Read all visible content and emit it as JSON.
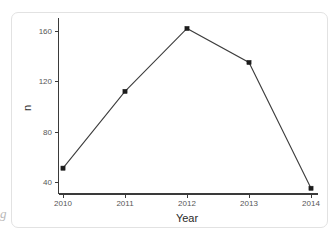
{
  "card": {
    "background_color": "#ffffff",
    "border_color": "#e2e2e2"
  },
  "edge_artifact": {
    "glyph": "g"
  },
  "chart_data": {
    "type": "line",
    "title": "",
    "subtitle": "",
    "xlabel": "Year",
    "ylabel": "n",
    "categories": [
      "2010",
      "2011",
      "2012",
      "2013",
      "2014"
    ],
    "x": [
      2010,
      2011,
      2012,
      2013,
      2014
    ],
    "values": [
      51,
      112,
      162,
      135,
      35
    ],
    "series": [
      {
        "name": "n",
        "values": [
          51,
          112,
          162,
          135,
          35
        ],
        "line_color": "#3d3d3d",
        "marker_color": "#1c1c1c",
        "marker": "square"
      }
    ],
    "xtick_labels": [
      "2010",
      "2011",
      "2012",
      "2013",
      "2014"
    ],
    "ytick_labels": [
      "40",
      "80",
      "120",
      "160"
    ],
    "ytick_values": [
      40,
      80,
      120,
      160
    ],
    "xlim": [
      2009.7,
      2014.3
    ],
    "ylim": [
      28,
      172
    ],
    "grid": false,
    "legend": false,
    "legend_position": "none",
    "axis_color": "#3a3a3a",
    "tick_label_color": "#565656",
    "axis_title_color": "#2b2b2b"
  }
}
